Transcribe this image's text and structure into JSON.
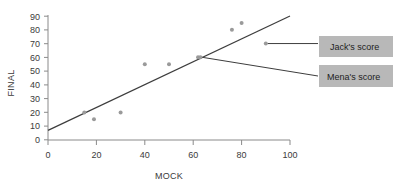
{
  "chart_data": {
    "type": "scatter",
    "title": "",
    "xlabel": "MOCK",
    "ylabel": "FINAL",
    "xlim": [
      0,
      100
    ],
    "ylim": [
      0,
      90
    ],
    "xticks": [
      0,
      20,
      40,
      60,
      80,
      100
    ],
    "yticks": [
      0,
      10,
      20,
      30,
      40,
      50,
      60,
      70,
      80,
      90
    ],
    "grid": false,
    "legend": "none",
    "point_color": "#9a9a9a",
    "line_color": "#3d3d3d",
    "axis_color": "#808080",
    "series": [
      {
        "name": "students",
        "points": [
          {
            "x": 15,
            "y": 20
          },
          {
            "x": 19,
            "y": 15
          },
          {
            "x": 30,
            "y": 20
          },
          {
            "x": 40,
            "y": 55
          },
          {
            "x": 50,
            "y": 55
          },
          {
            "x": 62,
            "y": 60
          },
          {
            "x": 63,
            "y": 60
          },
          {
            "x": 76,
            "y": 80
          },
          {
            "x": 80,
            "y": 85
          },
          {
            "x": 90,
            "y": 70
          }
        ]
      }
    ],
    "trendline": {
      "name": "line of best fit",
      "x0": 0,
      "y0": 7,
      "x1": 100,
      "y1": 90
    },
    "annotations": [
      {
        "id": "jacks-score",
        "label": "Jack's score",
        "target_x": 90,
        "target_y": 70,
        "box_fill": "#b8b8b8",
        "box_text_color": "#1d1d1d"
      },
      {
        "id": "menas-score",
        "label": "Mena's score",
        "target_x": 63,
        "target_y": 60,
        "box_fill": "#b8b8b8",
        "box_text_color": "#1d1d1d"
      }
    ]
  },
  "axes": {
    "x_title": "MOCK",
    "y_title": "FINAL",
    "x_tick_labels": [
      "0",
      "20",
      "40",
      "60",
      "80",
      "100"
    ],
    "y_tick_labels": [
      "0",
      "10",
      "20",
      "30",
      "40",
      "50",
      "60",
      "70",
      "80",
      "90"
    ]
  },
  "callouts": {
    "jack": "Jack's score",
    "mena": "Mena's score"
  }
}
